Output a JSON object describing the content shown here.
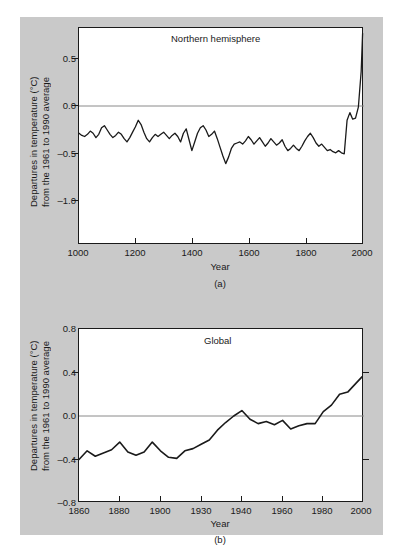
{
  "figure": {
    "background_color": "#c9c9c9",
    "plot_background_color": "#ffffff",
    "line_color": "#1a1a1a",
    "axis_color": "#1a1a1a",
    "zero_line_color": "#8a8a8a"
  },
  "panel_a": {
    "caption": "(a)",
    "title": "Northern hemisphere",
    "xlabel": "Year",
    "ylabel_line1": "Departures in temperature (°C)",
    "ylabel_line2": "from the 1961 to 1990 average",
    "xticks": [
      "1000",
      "1200",
      "1400",
      "1600",
      "1800",
      "2000"
    ],
    "yticks": [
      "0.5",
      "0.0",
      "–0.5",
      "–1.0"
    ]
  },
  "panel_b": {
    "caption": "(b)",
    "title": "Global",
    "xlabel": "Year",
    "ylabel_line1": "Departures in temperature (°C)",
    "ylabel_line2": "from the 1961 to 1990 average",
    "xticks": [
      "1860",
      "1880",
      "1900",
      "1930",
      "1940",
      "1960",
      "1980",
      "2000"
    ],
    "yticks": [
      "0.8",
      "0.4",
      "0.0",
      "–0.4",
      "–0.8"
    ]
  },
  "chart_data": [
    {
      "id": "panel_a",
      "type": "line",
      "title": "Northern hemisphere",
      "subtitle": "(a)",
      "xlabel": "Year",
      "ylabel": "Departures in temperature (°C) from the 1961 to 1990 average",
      "xlim": [
        1000,
        2010
      ],
      "ylim": [
        -1.25,
        0.75
      ],
      "xticks": [
        1000,
        1200,
        1400,
        1600,
        1800,
        2000
      ],
      "yticks": [
        0.5,
        0.0,
        -0.5,
        -1.0
      ],
      "grid": false,
      "legend": "none",
      "zero_reference_line": 0.0,
      "series": [
        {
          "name": "Northern hemisphere temperature anomaly",
          "x": [
            1000,
            1010,
            1020,
            1030,
            1040,
            1050,
            1060,
            1070,
            1080,
            1090,
            1100,
            1110,
            1120,
            1130,
            1140,
            1150,
            1160,
            1170,
            1180,
            1190,
            1200,
            1210,
            1220,
            1230,
            1240,
            1250,
            1260,
            1270,
            1280,
            1290,
            1300,
            1310,
            1320,
            1330,
            1340,
            1350,
            1360,
            1370,
            1380,
            1390,
            1400,
            1410,
            1420,
            1430,
            1440,
            1450,
            1460,
            1470,
            1480,
            1490,
            1500,
            1510,
            1520,
            1530,
            1540,
            1550,
            1560,
            1570,
            1580,
            1590,
            1600,
            1610,
            1620,
            1630,
            1640,
            1650,
            1660,
            1670,
            1680,
            1690,
            1700,
            1710,
            1720,
            1730,
            1740,
            1750,
            1760,
            1770,
            1780,
            1790,
            1800,
            1810,
            1820,
            1830,
            1840,
            1850,
            1860,
            1870,
            1880,
            1890,
            1900,
            1910,
            1920,
            1930,
            1940,
            1950,
            1960,
            1970,
            1980,
            1990,
            2000,
            2005
          ],
          "y": [
            -0.22,
            -0.24,
            -0.25,
            -0.23,
            -0.2,
            -0.22,
            -0.26,
            -0.23,
            -0.17,
            -0.15,
            -0.19,
            -0.23,
            -0.26,
            -0.24,
            -0.21,
            -0.23,
            -0.27,
            -0.3,
            -0.26,
            -0.21,
            -0.16,
            -0.1,
            -0.14,
            -0.21,
            -0.27,
            -0.3,
            -0.26,
            -0.23,
            -0.25,
            -0.23,
            -0.21,
            -0.24,
            -0.27,
            -0.24,
            -0.22,
            -0.25,
            -0.3,
            -0.22,
            -0.18,
            -0.28,
            -0.38,
            -0.3,
            -0.22,
            -0.17,
            -0.15,
            -0.19,
            -0.25,
            -0.23,
            -0.2,
            -0.27,
            -0.35,
            -0.43,
            -0.5,
            -0.44,
            -0.36,
            -0.32,
            -0.31,
            -0.3,
            -0.32,
            -0.29,
            -0.25,
            -0.28,
            -0.32,
            -0.29,
            -0.26,
            -0.3,
            -0.34,
            -0.31,
            -0.27,
            -0.3,
            -0.33,
            -0.31,
            -0.28,
            -0.34,
            -0.38,
            -0.36,
            -0.33,
            -0.36,
            -0.38,
            -0.34,
            -0.29,
            -0.25,
            -0.22,
            -0.26,
            -0.31,
            -0.34,
            -0.32,
            -0.35,
            -0.38,
            -0.37,
            -0.39,
            -0.4,
            -0.38,
            -0.4,
            -0.41,
            -0.1,
            -0.03,
            -0.09,
            -0.08,
            0.02,
            0.35,
            0.7
          ]
        }
      ]
    },
    {
      "id": "panel_b",
      "type": "line",
      "title": "Global",
      "subtitle": "(b)",
      "xlabel": "Year",
      "ylabel": "Departures in temperature (°C) from the 1961 to 1990 average",
      "xlim": [
        1860,
        2000
      ],
      "ylim": [
        -0.8,
        0.8
      ],
      "xticks": [
        1860,
        1880,
        1900,
        1930,
        1940,
        1960,
        1980,
        2000
      ],
      "yticks": [
        0.8,
        0.4,
        0.0,
        -0.4,
        -0.8
      ],
      "grid": false,
      "legend": "none",
      "zero_reference_line": 0.0,
      "series": [
        {
          "name": "Global temperature anomaly",
          "x": [
            1860,
            1864,
            1868,
            1872,
            1876,
            1880,
            1884,
            1888,
            1892,
            1896,
            1900,
            1904,
            1908,
            1912,
            1916,
            1920,
            1924,
            1928,
            1932,
            1936,
            1940,
            1944,
            1948,
            1952,
            1956,
            1960,
            1964,
            1968,
            1972,
            1976,
            1980,
            1984,
            1988,
            1992,
            1996,
            1999
          ],
          "y": [
            -0.4,
            -0.32,
            -0.37,
            -0.34,
            -0.31,
            -0.24,
            -0.33,
            -0.36,
            -0.33,
            -0.24,
            -0.32,
            -0.38,
            -0.39,
            -0.32,
            -0.3,
            -0.26,
            -0.22,
            -0.13,
            -0.06,
            0.0,
            0.05,
            -0.03,
            -0.07,
            -0.05,
            -0.08,
            -0.04,
            -0.12,
            -0.09,
            -0.07,
            -0.07,
            0.04,
            0.1,
            0.2,
            0.22,
            0.3,
            0.36
          ]
        }
      ]
    }
  ]
}
